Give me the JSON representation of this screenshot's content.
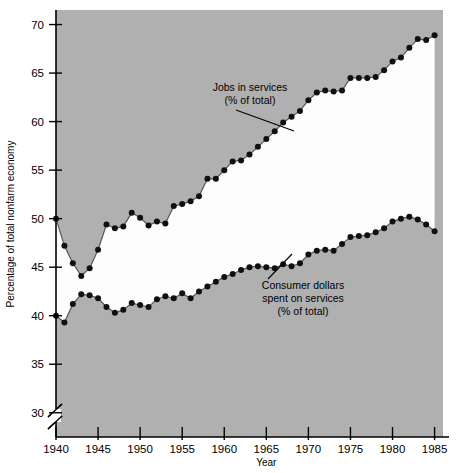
{
  "chart_data": {
    "type": "line",
    "title": "",
    "xlabel": "Year",
    "ylabel": "Percentage of total nonfarm economy",
    "xlim": [
      1940,
      1986
    ],
    "ylim": [
      27.5,
      71.5
    ],
    "xticks": [
      1940,
      1945,
      1950,
      1955,
      1960,
      1965,
      1970,
      1975,
      1980,
      1985
    ],
    "yticks": [
      30,
      35,
      40,
      45,
      50,
      55,
      60,
      65,
      70
    ],
    "y_axis_break": true,
    "y_axis_break_note": "axis broken below 30",
    "grid": false,
    "legend": "annotations-on-plot",
    "shaded_band": "area between the two series is white; outside is grey",
    "x": [
      1940,
      1941,
      1942,
      1943,
      1944,
      1945,
      1946,
      1947,
      1948,
      1949,
      1950,
      1951,
      1952,
      1953,
      1954,
      1955,
      1956,
      1957,
      1958,
      1959,
      1960,
      1961,
      1962,
      1963,
      1964,
      1965,
      1966,
      1967,
      1968,
      1969,
      1970,
      1971,
      1972,
      1973,
      1974,
      1975,
      1976,
      1977,
      1978,
      1979,
      1980,
      1981,
      1982,
      1983,
      1984,
      1985
    ],
    "series": [
      {
        "name": "Jobs in services (% of total)",
        "label_line1": "Jobs in services",
        "label_line2": "(% of total)",
        "values": [
          50.0,
          47.2,
          45.4,
          44.1,
          44.9,
          46.8,
          49.4,
          49.0,
          49.2,
          50.6,
          50.1,
          49.3,
          49.7,
          49.5,
          51.3,
          51.5,
          51.8,
          52.3,
          54.1,
          54.1,
          55.0,
          55.9,
          56.0,
          56.6,
          57.4,
          58.2,
          59.0,
          59.9,
          60.5,
          61.1,
          62.2,
          63.0,
          63.2,
          63.1,
          63.2,
          64.5,
          64.5,
          64.5,
          64.6,
          65.3,
          66.2,
          66.6,
          67.6,
          68.5,
          68.4,
          68.9
        ]
      },
      {
        "name": "Consumer dollars spent on services (% of total)",
        "label_line1": "Consumer dollars",
        "label_line2": "spent on services",
        "label_line3": "(% of total)",
        "values": [
          40.0,
          39.3,
          41.2,
          42.2,
          42.1,
          41.8,
          40.9,
          40.3,
          40.6,
          41.3,
          41.1,
          40.9,
          41.7,
          42.0,
          41.8,
          42.3,
          41.8,
          42.5,
          43.0,
          43.5,
          44.0,
          44.3,
          44.7,
          45.0,
          45.1,
          45.0,
          44.9,
          45.3,
          45.1,
          45.4,
          46.3,
          46.7,
          46.8,
          46.7,
          47.4,
          48.1,
          48.2,
          48.3,
          48.6,
          49.0,
          49.7,
          50.0,
          50.2,
          49.9,
          49.4,
          48.7
        ]
      }
    ]
  },
  "axes": {
    "x_axis_label": "Year",
    "y_axis_label": "Percentage of total nonfarm economy",
    "x_tick_labels": [
      "1940",
      "1945",
      "1950",
      "1955",
      "1960",
      "1965",
      "1970",
      "1975",
      "1980",
      "1985"
    ],
    "y_tick_labels": [
      "30",
      "35",
      "40",
      "45",
      "50",
      "55",
      "60",
      "65",
      "70"
    ]
  },
  "annotations": {
    "jobs": {
      "line1": "Jobs in services",
      "line2": "(% of total)"
    },
    "consumer": {
      "line1": "Consumer dollars",
      "line2": "spent on services",
      "line3": "(% of total)"
    }
  },
  "colors": {
    "plot_background": "#b0b0b0",
    "band_fill": "#fdfdfd",
    "marker": "#101010",
    "line": "#555555",
    "axis": "#000000",
    "page_background": "#ffffff"
  }
}
